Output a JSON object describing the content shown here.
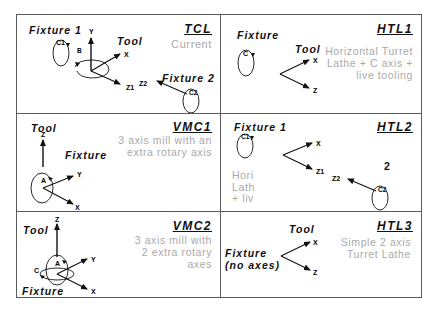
{
  "panels": [
    {
      "id": "TCL",
      "code": "TCL",
      "description": "Current",
      "labels": [
        {
          "text": "Fixture 1",
          "x": 12,
          "y": 9
        },
        {
          "text": "Tool",
          "x": 100,
          "y": 20
        },
        {
          "text": "Fixture 2",
          "x": 145,
          "y": 57
        }
      ],
      "axis_labels": [
        "Y",
        "X",
        "Z1",
        "B",
        "C1",
        "Z2",
        "C2"
      ]
    },
    {
      "id": "HTL1",
      "code": "HTL1",
      "description": "Horizontal Turret\nLathe + C axis +\nlive tooling",
      "labels": [
        {
          "text": "Fixture",
          "x": 20,
          "y": 14
        },
        {
          "text": "Tool",
          "x": 77,
          "y": 29
        }
      ],
      "axis_labels": [
        "C",
        "X",
        "Z"
      ]
    },
    {
      "id": "VMC1",
      "code": "VMC1",
      "description": "3 axis mill with an\nextra rotary axis",
      "labels": [
        {
          "text": "Tool",
          "x": 14,
          "y": 10
        },
        {
          "text": "Fixture",
          "x": 48,
          "y": 39
        }
      ],
      "axis_labels": [
        "Z",
        "A",
        "Y",
        "X"
      ]
    },
    {
      "id": "HTL2",
      "code": "HTL2",
      "description": "Hori\nLath\n+ liv",
      "labels": [
        {
          "text": "Fixture 1",
          "x": 13,
          "y": 9
        }
      ],
      "extra_text": "2",
      "axis_labels": [
        "C1",
        "X",
        "Z1",
        "Z2",
        "C2"
      ]
    },
    {
      "id": "VMC2",
      "code": "VMC2",
      "description": "3 axis mill with\n2 extra rotary\naxes",
      "labels": [
        {
          "text": "Tool",
          "x": 6,
          "y": 14
        },
        {
          "text": "Fixture",
          "x": 5,
          "y": 73
        }
      ],
      "axis_labels": [
        "Z",
        "A",
        "C",
        "Y",
        "X"
      ]
    },
    {
      "id": "HTL3",
      "code": "HTL3",
      "description": "Simple 2 axis\nTurret Lathe",
      "labels": [
        {
          "text": "Tool",
          "x": 69,
          "y": 11
        },
        {
          "text": "Fixture\n(no axes)",
          "x": 5,
          "y": 35
        }
      ],
      "axis_labels": [
        "X",
        "Z"
      ]
    }
  ],
  "colors": {
    "line": "#111111",
    "border": "#5a5a5a",
    "description": "#a9a9a9"
  }
}
